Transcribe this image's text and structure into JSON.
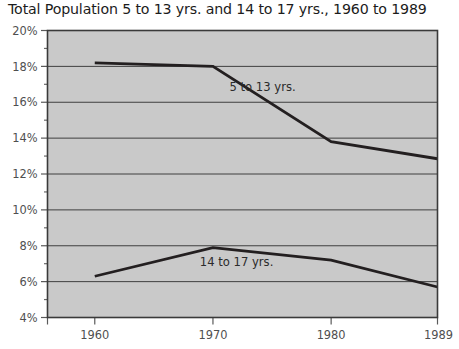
{
  "chart_data": {
    "type": "line",
    "title": "Total Population 5 to 13 yrs. and 14 to 17 yrs., 1960 to 1989",
    "xlabel": "",
    "ylabel": "",
    "x": [
      1960,
      1970,
      1980,
      1989
    ],
    "xtick_labels": [
      "1960",
      "1970",
      "1980",
      "1989"
    ],
    "ytick_labels": [
      "4%",
      "6%",
      "8%",
      "10%",
      "12%",
      "14%",
      "16%",
      "18%",
      "20%"
    ],
    "ytick_values": [
      4,
      6,
      8,
      10,
      12,
      14,
      16,
      18,
      20
    ],
    "yminor_values": [
      5,
      7,
      9,
      11,
      13,
      15,
      17,
      19
    ],
    "ylim": [
      4,
      20
    ],
    "xlim": [
      1956,
      1989
    ],
    "grid": "horizontal-major",
    "legend_position": "inline-annotations",
    "series": [
      {
        "name": "5 to 13 yrs.",
        "values": [
          18.2,
          18.0,
          13.8,
          12.85
        ],
        "label_x": 1974.2,
        "label_y": 16.6,
        "color": "#231f20"
      },
      {
        "name": "14 to 17 yrs.",
        "values": [
          6.3,
          7.9,
          7.2,
          5.7
        ],
        "label_x": 1972.0,
        "label_y": 6.85,
        "color": "#231f20"
      }
    ],
    "plot_background": "#c9c9c9",
    "plot_border_color": "#3a3a3a",
    "gridline_color": "#3f3f3f",
    "line_color": "#231f20"
  }
}
